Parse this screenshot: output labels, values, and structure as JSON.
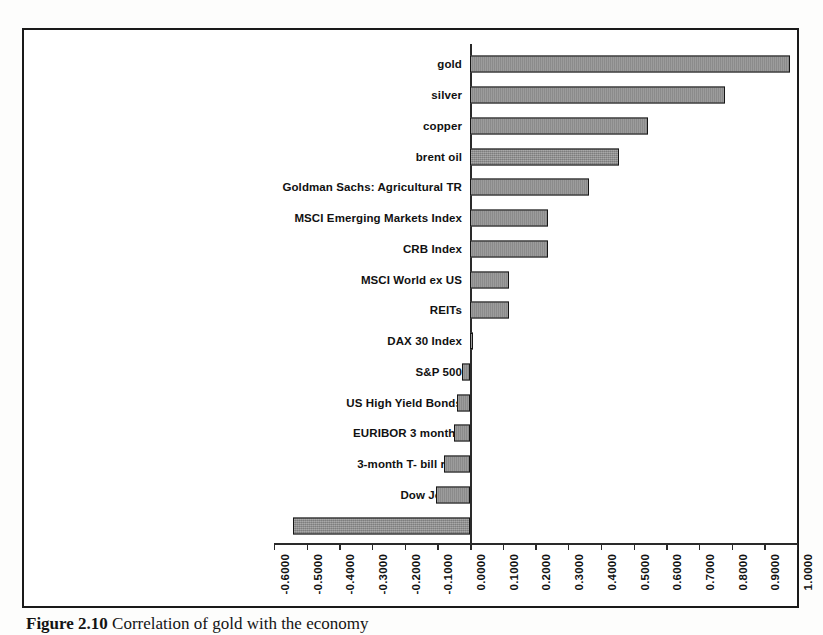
{
  "figure": {
    "caption_label": "Figure 2.10",
    "caption_text": "Correlation of gold with the economy"
  },
  "chart_data": {
    "type": "bar",
    "orientation": "horizontal",
    "title": "",
    "xlabel": "",
    "ylabel": "",
    "xlim": [
      -0.6,
      1.0
    ],
    "xtick_step": 0.1,
    "grid": false,
    "legend": "none",
    "bar_color": "#8c8c8c",
    "bar_border_color": "#151515",
    "categories": [
      "gold",
      "silver",
      "copper",
      "brent oil",
      "Goldman Sachs: Agricultural TR",
      "MSCI Emerging Markets Index",
      "CRB Index",
      "MSCI World ex US",
      "REITs",
      "DAX 30 Index",
      "S&P 500",
      "US High Yield Bonds",
      "EURIBOR 3 months",
      "3-month T- bill rate",
      "Dow Jones",
      "US Dollar Index (DXY)"
    ],
    "values": [
      0.98,
      0.78,
      0.545,
      0.455,
      0.365,
      0.24,
      0.24,
      0.12,
      0.12,
      0.01,
      -0.025,
      -0.04,
      -0.05,
      -0.08,
      -0.105,
      -0.54
    ],
    "xticks": [
      "-0.6000",
      "-0.5000",
      "-0.4000",
      "-0.3000",
      "-0.2000",
      "-0.1000",
      "0.0000",
      "0.1000",
      "0.2000",
      "0.3000",
      "0.4000",
      "0.5000",
      "0.6000",
      "0.7000",
      "0.8000",
      "0.9000",
      "1.0000"
    ],
    "xtick_values": [
      -0.6,
      -0.5,
      -0.4,
      -0.3,
      -0.2,
      -0.1,
      0,
      0.1,
      0.2,
      0.3,
      0.4,
      0.5,
      0.6,
      0.7,
      0.8,
      0.9,
      1.0
    ]
  }
}
